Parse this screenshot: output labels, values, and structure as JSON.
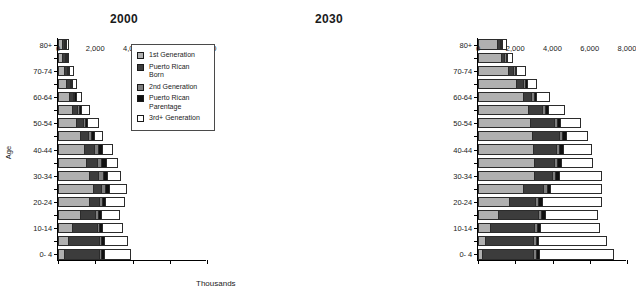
{
  "figure": {
    "xlabel": "Thousands",
    "ylabel": "Age"
  },
  "legend": {
    "items": [
      {
        "label": "1st Generation",
        "color": "#b0b0b0",
        "key": "gen1"
      },
      {
        "label": "Puerto Rican\nBorn",
        "color": "#3c3c3c",
        "key": "pr_born"
      },
      {
        "label": "2nd Generation",
        "color": "#7d7d7d",
        "key": "gen2"
      },
      {
        "label": "Puerto Rican\nParentage",
        "color": "#101010",
        "key": "pr_parentage"
      },
      {
        "label": "3rd+ Generation",
        "color": "#ffffff",
        "key": "gen3plus"
      }
    ]
  },
  "chart_data": [
    {
      "type": "bar",
      "orientation": "horizontal",
      "stacked": true,
      "title": "2000",
      "xlabel": "Thousands",
      "ylabel": "Age",
      "xlim": [
        0,
        8000
      ],
      "xticks": [
        0,
        2000,
        4000,
        6000,
        8000
      ],
      "xtick_labels": [
        "0",
        "2,000",
        "4,000",
        "6,000",
        "8,000"
      ],
      "grid": false,
      "legend_position": "center-right-inside",
      "categories": [
        "0- 4",
        "5- 9",
        "10-14",
        "15-19",
        "20-24",
        "25-29",
        "30-34",
        "35-39",
        "40-44",
        "45-49",
        "50-54",
        "55-59",
        "60-64",
        "65-69",
        "70-74",
        "75-79",
        "80+"
      ],
      "ytick_labels_shown": [
        "0- 4",
        "10-14",
        "20-24",
        "30-34",
        "40-44",
        "50-54",
        "60-64",
        "70-74",
        "80+"
      ],
      "series": [
        {
          "name": "1st Generation",
          "color": "#b0b0b0",
          "values": [
            330,
            530,
            760,
            1160,
            1660,
            1900,
            1640,
            1480,
            1400,
            1200,
            980,
            760,
            570,
            440,
            330,
            230,
            200
          ]
        },
        {
          "name": "Puerto Rican Born",
          "color": "#3c3c3c",
          "values": [
            1870,
            1650,
            1330,
            840,
            520,
            430,
            520,
            620,
            560,
            430,
            340,
            260,
            230,
            200,
            170,
            140,
            130
          ]
        },
        {
          "name": "2nd Generation",
          "color": "#7d7d7d",
          "values": [
            130,
            140,
            130,
            130,
            190,
            220,
            240,
            230,
            190,
            150,
            120,
            100,
            80,
            60,
            50,
            40,
            30
          ]
        },
        {
          "name": "Puerto Rican Parentage",
          "color": "#101010",
          "values": [
            130,
            130,
            150,
            160,
            180,
            200,
            220,
            230,
            210,
            170,
            140,
            110,
            90,
            70,
            60,
            50,
            40
          ]
        },
        {
          "name": "3rd+ Generation",
          "color": "#ffffff",
          "values": [
            1480,
            1290,
            1140,
            1050,
            1050,
            930,
            790,
            660,
            570,
            480,
            620,
            480,
            330,
            230,
            220,
            140,
            130
          ]
        }
      ]
    },
    {
      "type": "bar",
      "orientation": "horizontal",
      "stacked": true,
      "title": "2030",
      "xlabel": "Thousands",
      "ylabel": "Age",
      "xlim": [
        0,
        8000
      ],
      "xticks": [
        0,
        2000,
        4000,
        6000,
        8000
      ],
      "xtick_labels": [
        "0",
        "2,000",
        "4,000",
        "6,000",
        "8,000"
      ],
      "grid": false,
      "legend_position": "none",
      "categories": [
        "0- 4",
        "5- 9",
        "10-14",
        "15-19",
        "20-24",
        "25-29",
        "30-34",
        "35-39",
        "40-44",
        "45-49",
        "50-54",
        "55-59",
        "60-64",
        "65-69",
        "70-74",
        "75-79",
        "80+"
      ],
      "ytick_labels_shown": [
        "0- 4",
        "10-14",
        "20-24",
        "30-34",
        "40-44",
        "50-54",
        "60-64",
        "70-74",
        "80+"
      ],
      "series": [
        {
          "name": "1st Generation",
          "color": "#b0b0b0",
          "values": [
            200,
            390,
            620,
            1080,
            1680,
            2400,
            3030,
            3000,
            2930,
            2900,
            2800,
            2660,
            2400,
            2060,
            1630,
            1220,
            1010
          ]
        },
        {
          "name": "Puerto Rican Born",
          "color": "#3c3c3c",
          "values": [
            2760,
            2540,
            2400,
            2160,
            1380,
            1100,
            920,
            1060,
            1240,
            1430,
            1270,
            780,
            450,
            330,
            250,
            190,
            170
          ]
        },
        {
          "name": "2nd Generation",
          "color": "#7d7d7d",
          "values": [
            160,
            160,
            160,
            170,
            180,
            180,
            180,
            180,
            180,
            180,
            170,
            160,
            140,
            110,
            90,
            70,
            60
          ]
        },
        {
          "name": "Puerto Rican Parentage",
          "color": "#101010",
          "values": [
            160,
            160,
            170,
            180,
            200,
            200,
            200,
            200,
            200,
            190,
            180,
            160,
            140,
            110,
            90,
            70,
            60
          ]
        },
        {
          "name": "3rd+ Generation",
          "color": "#ffffff",
          "values": [
            4040,
            3700,
            3190,
            2860,
            3200,
            2760,
            2340,
            1760,
            1550,
            1200,
            1100,
            910,
            740,
            580,
            500,
            330,
            270
          ]
        }
      ]
    }
  ]
}
